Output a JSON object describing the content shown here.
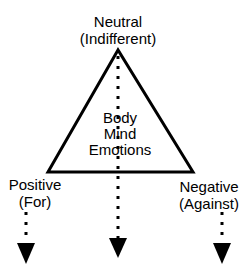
{
  "top": {
    "line1": "Neutral",
    "line2": "(Indifferent)"
  },
  "center": {
    "line1": "Body",
    "line2": "Mind",
    "line3": "Emotions"
  },
  "left": {
    "line1": "Positive",
    "line2": "(For)"
  },
  "right": {
    "line1": "Negative",
    "line2": "(Against)"
  },
  "colors": {
    "stroke": "#000000",
    "background": "#ffffff"
  }
}
